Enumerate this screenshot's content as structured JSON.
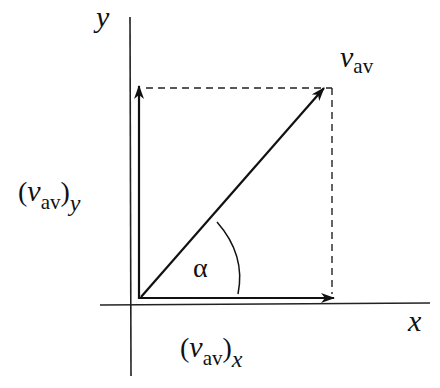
{
  "diagram": {
    "type": "vector-decomposition",
    "axes": {
      "x_label": "x",
      "y_label": "y"
    },
    "vector": {
      "symbol": "v",
      "subscript": "av"
    },
    "components": {
      "y": {
        "open": "(",
        "symbol": "v",
        "subscript": "av",
        "close": ")",
        "component": "y"
      },
      "x": {
        "open": "(",
        "symbol": "v",
        "subscript": "av",
        "close": ")",
        "component": "x"
      }
    },
    "angle_label": "α",
    "colors": {
      "stroke": "#111111",
      "background": "#ffffff"
    }
  }
}
